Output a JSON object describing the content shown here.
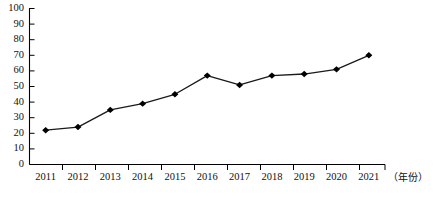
{
  "chart_data": {
    "type": "line",
    "title": "",
    "subtitle": "",
    "xlabel": "（年份）",
    "ylabel": "",
    "categories": [
      "2011",
      "2012",
      "2013",
      "2014",
      "2015",
      "2016",
      "2017",
      "2018",
      "2019",
      "2020",
      "2021"
    ],
    "values": [
      22,
      24,
      35,
      39,
      45,
      57,
      51,
      57,
      58,
      61,
      70
    ],
    "series": [
      {
        "name": "",
        "values": [
          22,
          24,
          35,
          39,
          45,
          57,
          51,
          57,
          58,
          61,
          70
        ]
      }
    ],
    "ylim": [
      0,
      100
    ],
    "y_ticks": [
      0,
      10,
      20,
      30,
      40,
      50,
      60,
      70,
      80,
      90,
      100
    ],
    "y_tick_labels": [
      "0",
      "10",
      "20",
      "30",
      "40",
      "50",
      "60",
      "70",
      "80",
      "90",
      "100"
    ],
    "x_tick_labels": [
      "2011",
      "2012",
      "2013",
      "2014",
      "2015",
      "2016",
      "2017",
      "2018",
      "2019",
      "2020",
      "2021"
    ],
    "grid": false,
    "legend": null,
    "legend_position": "none",
    "marker": "diamond",
    "line_color": "#1a1a1a",
    "marker_color": "#000000",
    "axis_color": "#000000",
    "background_color": "#ffffff",
    "annotations": []
  },
  "axes": {
    "x_axis_title": "（年份）"
  }
}
